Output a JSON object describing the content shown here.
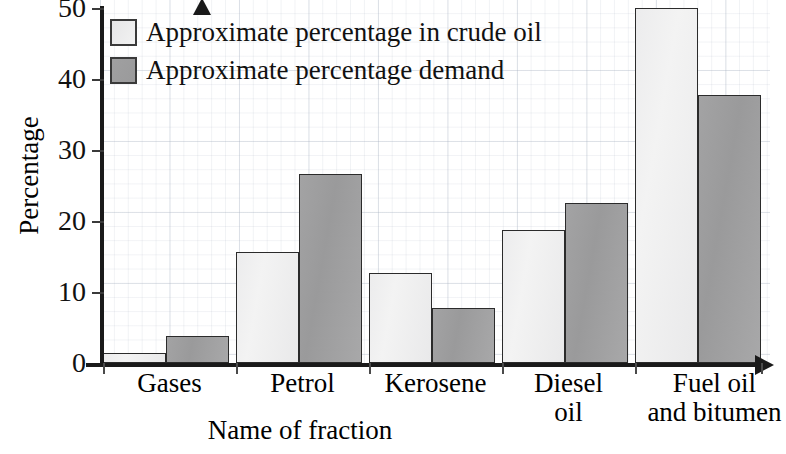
{
  "chart_data": {
    "type": "bar",
    "title": "",
    "xlabel": "Name of fraction",
    "ylabel": "Percentage",
    "categories": [
      "Gases",
      "Petrol",
      "Kerosene",
      "Diesel\noil",
      "Fuel oil\nand bitumen"
    ],
    "category_lines": [
      [
        "Gases"
      ],
      [
        "Petrol"
      ],
      [
        "Kerosene"
      ],
      [
        "Diesel",
        "oil"
      ],
      [
        "Fuel oil",
        "and bitumen"
      ]
    ],
    "series": [
      {
        "name": "Approximate percentage in crude oil",
        "color": "#eeeeee",
        "values": [
          1.4,
          15.6,
          12.7,
          18.8,
          50.0
        ]
      },
      {
        "name": "Approximate percentage demand",
        "color": "#9e9e9e",
        "values": [
          3.8,
          26.6,
          7.7,
          22.6,
          37.8
        ]
      }
    ],
    "ylim": [
      0,
      50
    ],
    "yticks": [
      0,
      10,
      20,
      30,
      40,
      50
    ],
    "ytick_labels": [
      "0",
      "10",
      "20",
      "30",
      "40",
      "50"
    ],
    "grid": true,
    "grid_style": "graph-paper",
    "legend_position": "top-left"
  },
  "legend": {
    "items": [
      {
        "label": "Approximate percentage in crude oil",
        "swatch": "light"
      },
      {
        "label": "Approximate percentage demand",
        "swatch": "dark"
      }
    ]
  },
  "axes": {
    "y_title": "Percentage",
    "x_title": "Name of fraction",
    "y_tick_0": "0",
    "y_tick_10": "10",
    "y_tick_20": "20",
    "y_tick_30": "30",
    "y_tick_40": "40",
    "y_tick_50": "50"
  },
  "x_labels": {
    "g0_l0": "Gases",
    "g1_l0": "Petrol",
    "g2_l0": "Kerosene",
    "g3_l0": "Diesel",
    "g3_l1": "oil",
    "g4_l0": "Fuel oil",
    "g4_l1": "and bitumen"
  }
}
